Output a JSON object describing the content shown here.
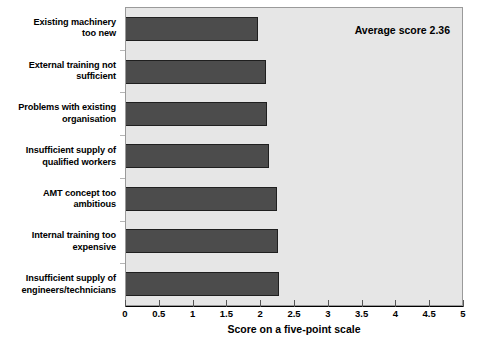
{
  "chart_data": {
    "type": "bar",
    "orientation": "horizontal",
    "title": "",
    "xlabel": "Score on a five-point scale",
    "ylabel": "",
    "xlim": [
      0,
      5
    ],
    "xticks": [
      "0",
      "0.5",
      "1",
      "1.5",
      "2",
      "2.5",
      "3",
      "3.5",
      "4",
      "4.5",
      "5"
    ],
    "xtick_values": [
      0,
      0.5,
      1,
      1.5,
      2,
      2.5,
      3,
      3.5,
      4,
      4.5,
      5
    ],
    "grid": false,
    "legend": "none",
    "categories": [
      "Existing machinery too new",
      "External training not sufficient",
      "Problems with existing organisation",
      "Insufficient supply of qualified workers",
      "AMT concept too ambitious",
      "Internal training too expensive",
      "Insufficient supply of engineers/technicians"
    ],
    "values": [
      1.96,
      2.07,
      2.08,
      2.12,
      2.23,
      2.25,
      2.26
    ],
    "annotations": [
      "Average score 2.36"
    ],
    "bar_color": "#4c4c4c",
    "plot_background": "#e6e6e6",
    "page_background": "#ffffff"
  },
  "labels": [
    {
      "line1": "Existing machinery",
      "line2": "too new"
    },
    {
      "line1": "External training not",
      "line2": "sufficient"
    },
    {
      "line1": "Problems with existing",
      "line2": "organisation"
    },
    {
      "line1": "Insufficient supply of",
      "line2": "qualified workers"
    },
    {
      "line1": "AMT concept too",
      "line2": "ambitious"
    },
    {
      "line1": "Internal training too",
      "line2": "expensive"
    },
    {
      "line1": "Insufficient supply of",
      "line2": "engineers/technicians"
    }
  ],
  "annotation": {
    "average_score_text": "Average score 2.36"
  },
  "axis": {
    "x_title": "Score on a five-point scale"
  }
}
